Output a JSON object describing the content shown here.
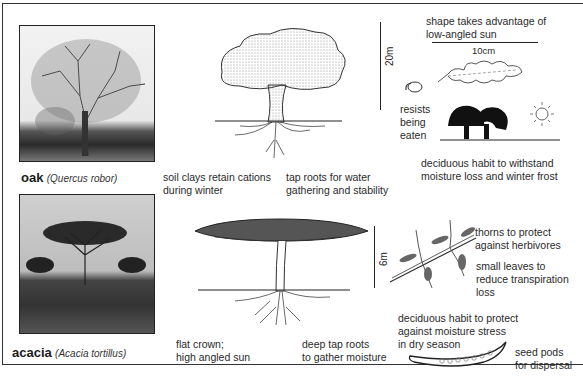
{
  "oak": {
    "common_name": "oak",
    "latin_name": "(Quercus robor)",
    "photo": "oak-tree-photo",
    "height_scale": "20m",
    "leaf_scale": "10cm",
    "annotations": {
      "soil": [
        "soil clays retain cations",
        "during winter"
      ],
      "roots": [
        "tap roots for water",
        "gathering and stability"
      ],
      "leaf_shape": [
        "shape takes advantage of",
        "low-angled sun"
      ],
      "acorn": [
        "resists",
        "being",
        "eaten"
      ],
      "deciduous": [
        "deciduous habit to withstand",
        "moisture loss and winter frost"
      ]
    }
  },
  "acacia": {
    "common_name": "acacia",
    "latin_name": "(Acacia tortillus)",
    "photo": "acacia-tree-photo",
    "height_scale": "6m",
    "annotations": {
      "crown": [
        "flat crown;",
        "high angled sun"
      ],
      "roots": [
        "deep tap roots",
        "to gather moisture"
      ],
      "thorns": [
        "thorns to protect",
        "against herbivores"
      ],
      "leaves": [
        "small leaves to",
        "reduce transpiration",
        "loss"
      ],
      "deciduous": [
        "deciduous habit to protect",
        "against moisture stress",
        "in dry season"
      ],
      "seed_pods": [
        "seed pods",
        "for dispersal"
      ]
    }
  }
}
